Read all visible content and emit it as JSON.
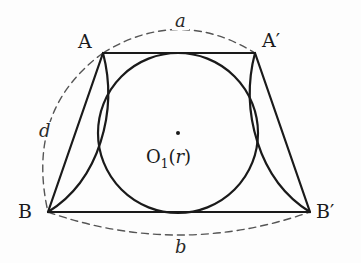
{
  "figure": {
    "type": "geometry-diagram",
    "background_color": "#fdfdfd",
    "stroke_color": "#1a1a1a",
    "dash_color": "#555555"
  },
  "vertices": {
    "A": {
      "label": "A",
      "x": 103,
      "y": 53,
      "label_x": 78,
      "label_y": 32
    },
    "A_prime": {
      "label": "A′",
      "x": 255,
      "y": 53,
      "label_x": 262,
      "label_y": 31
    },
    "B": {
      "label": "B",
      "x": 48,
      "y": 212,
      "label_x": 18,
      "label_y": 202
    },
    "B_prime": {
      "label": "B′",
      "x": 310,
      "y": 212,
      "label_x": 316,
      "label_y": 202
    }
  },
  "incircle": {
    "center_name": "O₁",
    "center_x": 178,
    "center_y": 133,
    "radius": 80,
    "center_dot_radius": 2.0,
    "label_main": "O",
    "label_sub": "1",
    "label_paren_open": "(",
    "label_radius": "r",
    "label_paren_close": ")",
    "label_full": "O₁(r)",
    "label_x": 146,
    "label_y": 148
  },
  "arcs": {
    "a": {
      "label": "a",
      "description": "dashed arc above from A to A′",
      "style": "dashed",
      "label_x": 172,
      "label_y": 12
    },
    "b": {
      "label": "b",
      "description": "dashed arc below from B to B′",
      "style": "dashed",
      "label_x": 172,
      "label_y": 238
    },
    "d": {
      "label": "d",
      "description": "dashed arc on left from A to B",
      "style": "dashed",
      "label_x": 36,
      "label_y": 122
    }
  },
  "solid_arcs": [
    {
      "name": "left-lens-arc",
      "from": "A",
      "to": "B",
      "description": "solid arc bulging right from A to B"
    },
    {
      "name": "right-lens-arc",
      "from": "A′",
      "to": "B′",
      "description": "solid arc bulging left from A′ to B′"
    }
  ],
  "segments": [
    {
      "name": "top-side-AA-prime",
      "from": "A",
      "to": "A′"
    },
    {
      "name": "bottom-side-BB-prime",
      "from": "B",
      "to": "B′"
    },
    {
      "name": "left-side-AB",
      "from": "A",
      "to": "B"
    },
    {
      "name": "right-side-A-prime-B-prime",
      "from": "A′",
      "to": "B′"
    }
  ]
}
